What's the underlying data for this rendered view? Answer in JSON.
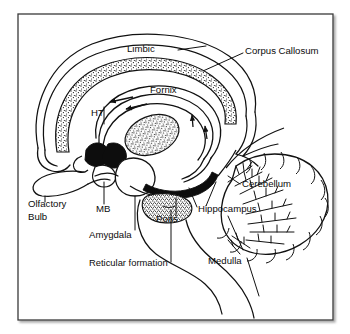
{
  "figure": {
    "background_color": "#ffffff",
    "ink_color": "#101010",
    "frame": {
      "name": "diagram-border",
      "x": 18,
      "y": 14,
      "width": 315,
      "height": 306,
      "stroke": "#3a3a3a",
      "shadow": true
    }
  },
  "labels": [
    {
      "id": "limbic",
      "text": "Limbic",
      "x": 127,
      "y": 52,
      "anchor": "start"
    },
    {
      "id": "corpus_callosum",
      "text": "Corpus Callosum",
      "x": 245,
      "y": 54,
      "anchor": "start"
    },
    {
      "id": "fornix",
      "text": "Fornix",
      "x": 150,
      "y": 93,
      "anchor": "start"
    },
    {
      "id": "ht",
      "text": "HT",
      "x": 91,
      "y": 116,
      "anchor": "start"
    },
    {
      "id": "cerebellum",
      "text": "Cerebellum",
      "x": 242,
      "y": 187,
      "anchor": "start"
    },
    {
      "id": "hippocampus",
      "text": "Hippocampus",
      "x": 198,
      "y": 212,
      "anchor": "start"
    },
    {
      "id": "olfactory_bulb_1",
      "text": "Olfactory",
      "x": 28,
      "y": 207,
      "anchor": "start"
    },
    {
      "id": "olfactory_bulb_2",
      "text": "Bulb",
      "x": 28,
      "y": 220,
      "anchor": "start"
    },
    {
      "id": "mb",
      "text": "MB",
      "x": 96,
      "y": 212,
      "anchor": "start"
    },
    {
      "id": "pons",
      "text": "Pons",
      "x": 156,
      "y": 222,
      "anchor": "start"
    },
    {
      "id": "amygdala",
      "text": "Amygdala",
      "x": 89,
      "y": 238,
      "anchor": "start"
    },
    {
      "id": "medulla",
      "text": "Medulla",
      "x": 208,
      "y": 264,
      "anchor": "start"
    },
    {
      "id": "reticular_formation",
      "text": "Reticular formation",
      "x": 89,
      "y": 266,
      "anchor": "start"
    }
  ],
  "structures": [
    {
      "id": "limbic-cortex-arc",
      "label": "Limbic",
      "style": "outline"
    },
    {
      "id": "corpus-callosum-band",
      "label": "Corpus Callosum",
      "style": "stippled"
    },
    {
      "id": "fornix-arc",
      "label": "Fornix",
      "style": "outline-with-arrows"
    },
    {
      "id": "thalamus-mass",
      "label": "Thalamus / central mass",
      "style": "stippled"
    },
    {
      "id": "hypothalamus",
      "label": "HT",
      "style": "solid-dark"
    },
    {
      "id": "mammillary-body",
      "label": "MB",
      "style": "outline"
    },
    {
      "id": "amygdala-body",
      "label": "Amygdala",
      "style": "outline"
    },
    {
      "id": "hippocampus-band",
      "label": "Hippocampus",
      "style": "solid-dark"
    },
    {
      "id": "pons-body",
      "label": "Pons",
      "style": "stippled"
    },
    {
      "id": "medulla-body",
      "label": "Medulla",
      "style": "outline"
    },
    {
      "id": "cerebellum-body",
      "label": "Cerebellum",
      "style": "arbor-vitae"
    },
    {
      "id": "olfactory-bulb-body",
      "label": "Olfactory Bulb",
      "style": "outline"
    },
    {
      "id": "reticular-formation-region",
      "label": "Reticular formation",
      "style": "outline"
    }
  ],
  "flow_arrows": [
    {
      "id": "arrow-fornix-anterior",
      "direction": "left",
      "along": "fornix"
    },
    {
      "id": "arrow-fornix-posterior",
      "direction": "up",
      "along": "fornix"
    },
    {
      "id": "arrow-fornix-mid",
      "direction": "up",
      "along": "fornix"
    },
    {
      "id": "arrow-fornix-top",
      "direction": "left",
      "along": "fornix"
    }
  ]
}
